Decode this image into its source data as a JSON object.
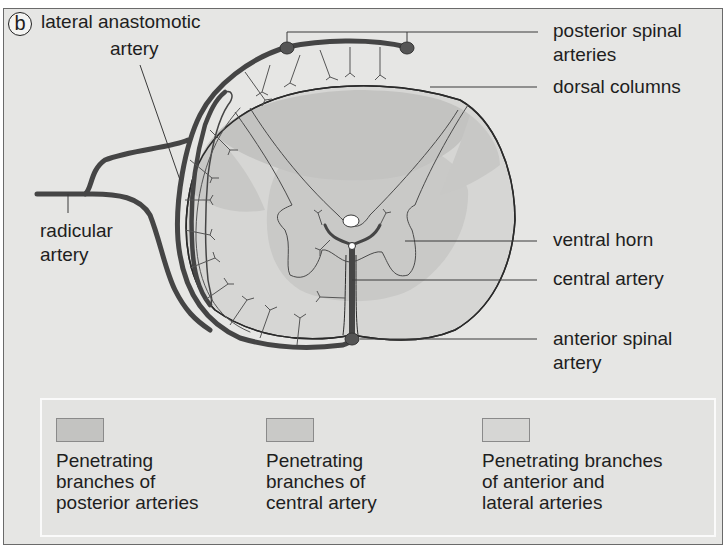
{
  "figure": {
    "panel_label": "b",
    "background_color": "#e6e6e4",
    "artery_color": "#4a4a4a",
    "colors": {
      "posterior_zone": "#c3c3c1",
      "central_zone": "#c9c9c7",
      "anterior_lateral_zone": "#d6d6d4"
    }
  },
  "labels": {
    "lateral_anastomotic_artery": "lateral anastomotic\nartery",
    "lateral_anastomotic_line1": "lateral anastomotic",
    "lateral_anastomotic_line2": "artery",
    "radicular_line1": "radicular",
    "radicular_line2": "artery",
    "posterior_spinal_line1": "posterior spinal",
    "posterior_spinal_line2": "arteries",
    "dorsal_columns": "dorsal columns",
    "ventral_horn": "ventral horn",
    "central_artery": "central artery",
    "anterior_spinal_line1": "anterior spinal",
    "anterior_spinal_line2": "artery"
  },
  "legend": {
    "items": [
      {
        "swatch_color": "#c3c3c1",
        "text": "Penetrating\nbranches of\nposterior arteries"
      },
      {
        "swatch_color": "#c9c9c7",
        "text": "Penetrating\nbranches of\ncentral artery"
      },
      {
        "swatch_color": "#d6d6d4",
        "text": "Penetrating branches\nof anterior and\nlateral arteries"
      }
    ]
  }
}
